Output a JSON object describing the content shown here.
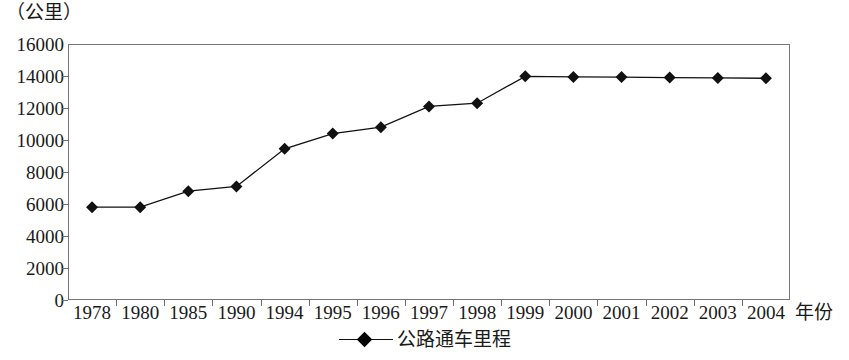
{
  "chart_data": {
    "type": "line",
    "title": "",
    "subtitle": "",
    "xlabel": "年份",
    "ylabel": "（公里）",
    "y_unit_caption": "（公里）",
    "categories": [
      "1978",
      "1980",
      "1985",
      "1990",
      "1994",
      "1995",
      "1996",
      "1997",
      "1998",
      "1999",
      "2000",
      "2001",
      "2002",
      "2003",
      "2004"
    ],
    "values": [
      5800,
      5800,
      6800,
      7100,
      9450,
      10400,
      10800,
      12100,
      12300,
      13980,
      13940,
      13930,
      13900,
      13880,
      13860
    ],
    "series": [
      {
        "name": "公路通车里程",
        "marker": "diamond",
        "color": "#111111",
        "values": [
          5800,
          5800,
          6800,
          7100,
          9450,
          10400,
          10800,
          12100,
          12300,
          13980,
          13940,
          13930,
          13900,
          13880,
          13860
        ]
      }
    ],
    "ylim": [
      0,
      16000
    ],
    "y_ticks": [
      0,
      2000,
      4000,
      6000,
      8000,
      10000,
      12000,
      14000,
      16000
    ],
    "y_tick_labels": [
      "0",
      "2000",
      "4000",
      "6000",
      "8000",
      "10000",
      "12000",
      "14000",
      "16000"
    ],
    "grid": false,
    "legend": {
      "position": "bottom-center",
      "entries": [
        {
          "label": "公路通车里程",
          "marker": "diamond",
          "color": "#111111"
        }
      ]
    }
  }
}
